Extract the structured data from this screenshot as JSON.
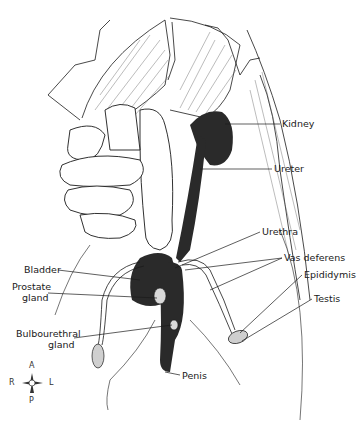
{
  "diagram": {
    "labels": {
      "kidney": "Kidney",
      "ureter": "Ureter",
      "urethra": "Urethra",
      "vas_deferens": "Vas deferens",
      "epididymis": "Epididymis",
      "testis": "Testis",
      "bladder": "Bladder",
      "prostate_line1": "Prostate",
      "prostate_line2": "gland",
      "bulbourethral_line1": "Bulbourethral",
      "bulbourethral_line2": "gland",
      "penis": "Penis"
    },
    "compass": {
      "top": "A",
      "bottom": "P",
      "left": "R",
      "right": "L"
    },
    "colors": {
      "organ_fill": "#3a3a3a",
      "line": "#1a1a1a",
      "stipple": "#bdbdbd",
      "background": "#ffffff"
    }
  }
}
